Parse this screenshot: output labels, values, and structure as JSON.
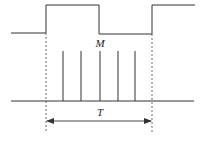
{
  "diagram": {
    "type": "timing-diagram",
    "labels": {
      "pulses": "M",
      "period": "T"
    },
    "gate_signal": {
      "low_level_y": 33,
      "high_level_y": 5,
      "segments": [
        {
          "level": "low",
          "x_start": 11,
          "x_end": 46
        },
        {
          "level": "high",
          "x_start": 46,
          "x_end": 99
        },
        {
          "level": "low",
          "x_start": 99,
          "x_end": 152
        },
        {
          "level": "high",
          "x_start": 152,
          "x_end": 195
        }
      ]
    },
    "pulse_train": {
      "baseline_y": 101,
      "top_y": 51,
      "count": 5,
      "x_positions": [
        63,
        81,
        100,
        118,
        135
      ]
    },
    "period_marker": {
      "x_start": 46,
      "x_end": 152,
      "y": 121
    },
    "colors": {
      "stroke": "#333333",
      "background": "#ffffff"
    }
  }
}
